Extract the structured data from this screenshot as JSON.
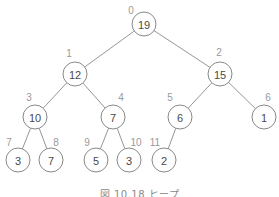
{
  "caption": "図 10.18  ヒープ",
  "colors": {
    "edge": "#8a8a8a",
    "node_stroke": "#7a7a7a",
    "node_text": "#4a4a4a",
    "index_text": "#9a9a9a"
  },
  "tree": {
    "type": "binary-heap",
    "array": [
      19,
      12,
      15,
      10,
      7,
      6,
      1,
      3,
      7,
      5,
      3,
      2
    ],
    "nodes": [
      {
        "index": "0",
        "value": "19",
        "cx": 144,
        "cy": 24,
        "lx": 131,
        "ly": 10
      },
      {
        "index": "1",
        "value": "12",
        "cx": 75,
        "cy": 74,
        "lx": 69,
        "ly": 53
      },
      {
        "index": "2",
        "value": "15",
        "cx": 220,
        "cy": 74,
        "lx": 219,
        "ly": 52
      },
      {
        "index": "3",
        "value": "10",
        "cx": 35,
        "cy": 117,
        "lx": 29,
        "ly": 97
      },
      {
        "index": "4",
        "value": "7",
        "cx": 113,
        "cy": 117,
        "lx": 121,
        "ly": 97
      },
      {
        "index": "5",
        "value": "6",
        "cx": 180,
        "cy": 117,
        "lx": 170,
        "ly": 97
      },
      {
        "index": "6",
        "value": "1",
        "cx": 264,
        "cy": 117,
        "lx": 268,
        "ly": 97
      },
      {
        "index": "7",
        "value": "3",
        "cx": 18,
        "cy": 160,
        "lx": 9,
        "ly": 142
      },
      {
        "index": "8",
        "value": "7",
        "cx": 51,
        "cy": 160,
        "lx": 56,
        "ly": 142
      },
      {
        "index": "9",
        "value": "5",
        "cx": 96,
        "cy": 160,
        "lx": 87,
        "ly": 142
      },
      {
        "index": "10",
        "value": "3",
        "cx": 129,
        "cy": 160,
        "lx": 136,
        "ly": 142
      },
      {
        "index": "11",
        "value": "2",
        "cx": 164,
        "cy": 160,
        "lx": 155,
        "ly": 142
      }
    ],
    "edges": [
      [
        0,
        1
      ],
      [
        0,
        2
      ],
      [
        1,
        3
      ],
      [
        1,
        4
      ],
      [
        2,
        5
      ],
      [
        2,
        6
      ],
      [
        3,
        7
      ],
      [
        3,
        8
      ],
      [
        4,
        9
      ],
      [
        4,
        10
      ],
      [
        5,
        11
      ]
    ],
    "radius": 12
  }
}
